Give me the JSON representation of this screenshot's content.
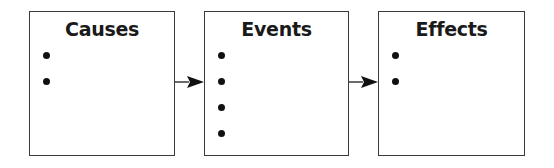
{
  "diagram": {
    "type": "flow",
    "direction": "left-to-right",
    "colors": {
      "stroke": "#3a3a3a",
      "text": "#1a1a1a",
      "background": "#ffffff"
    },
    "boxes": [
      {
        "title": "Causes",
        "bullet_count": 2
      },
      {
        "title": "Events",
        "bullet_count": 4
      },
      {
        "title": "Effects",
        "bullet_count": 2
      }
    ],
    "arrows": [
      {
        "from": "Causes",
        "to": "Events",
        "icon": "arrow-right-icon"
      },
      {
        "from": "Events",
        "to": "Effects",
        "icon": "arrow-right-icon"
      }
    ]
  }
}
